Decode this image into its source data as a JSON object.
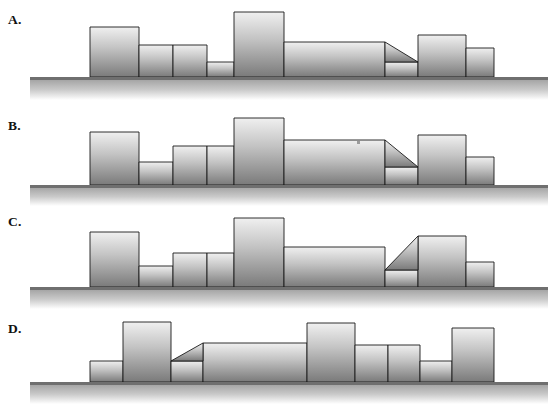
{
  "figure": {
    "type": "line-drawing",
    "background_color": "#ffffff",
    "ink_color": "#1a1a1a",
    "block_fill_top": "#f0f0f0",
    "block_fill_bottom": "#7a7a7a",
    "ground_color": "#6f6f6f",
    "partial_top_text": "",
    "panel_count": 4
  },
  "panels": [
    {
      "id": "A",
      "label": "A.",
      "label_x": 8,
      "label_y": 12,
      "top": 0,
      "height": 110,
      "ground_y": 77,
      "ground_x0": 30,
      "ground_x1": 548,
      "ground_thickness": 3,
      "ground_fade_height": 23,
      "blocks": [
        {
          "name": "block-1",
          "x": 90,
          "w": 49,
          "top": 27
        },
        {
          "name": "block-2",
          "x": 139,
          "w": 34,
          "top": 45
        },
        {
          "name": "block-3",
          "x": 173,
          "w": 34,
          "top": 45
        },
        {
          "name": "block-4",
          "x": 207,
          "w": 27,
          "top": 62
        },
        {
          "name": "block-5",
          "x": 234,
          "w": 50,
          "top": 12
        },
        {
          "name": "block-6",
          "x": 284,
          "w": 101,
          "top": 42
        },
        {
          "name": "block-7",
          "x": 385,
          "w": 33,
          "top": 62
        },
        {
          "name": "block-8",
          "x": 418,
          "w": 48,
          "top": 35
        },
        {
          "name": "block-9",
          "x": 466,
          "w": 28,
          "top": 48
        }
      ],
      "slope": {
        "name": "slope-descending",
        "x_start": 385,
        "y_start": 42,
        "x_end": 418,
        "y_end": 62,
        "direction": "down-right"
      }
    },
    {
      "id": "B",
      "label": "B.",
      "label_x": 8,
      "label_y": 118,
      "top": 110,
      "height": 98,
      "ground_y": 75,
      "ground_x0": 30,
      "ground_x1": 548,
      "ground_thickness": 3,
      "ground_fade_height": 21,
      "blocks": [
        {
          "name": "block-1",
          "x": 90,
          "w": 49,
          "top": 22
        },
        {
          "name": "block-2",
          "x": 139,
          "w": 34,
          "top": 52
        },
        {
          "name": "block-3",
          "x": 173,
          "w": 34,
          "top": 36
        },
        {
          "name": "block-4",
          "x": 207,
          "w": 27,
          "top": 36
        },
        {
          "name": "block-5",
          "x": 234,
          "w": 50,
          "top": 8
        },
        {
          "name": "block-6",
          "x": 284,
          "w": 101,
          "top": 30
        },
        {
          "name": "block-7",
          "x": 385,
          "w": 33,
          "top": 57
        },
        {
          "name": "block-8",
          "x": 418,
          "w": 48,
          "top": 25
        },
        {
          "name": "block-9",
          "x": 466,
          "w": 28,
          "top": 47
        }
      ],
      "slope": {
        "name": "slope-descending",
        "x_start": 385,
        "y_start": 30,
        "x_end": 418,
        "y_end": 57,
        "direction": "down-right"
      },
      "artifact": {
        "name": "stray-mark",
        "x": 357,
        "y": 31,
        "w": 3,
        "h": 3
      }
    },
    {
      "id": "C",
      "label": "C.",
      "label_x": 8,
      "label_y": 214,
      "top": 205,
      "height": 105,
      "ground_y": 82,
      "ground_x0": 30,
      "ground_x1": 548,
      "ground_thickness": 3,
      "ground_fade_height": 22,
      "blocks": [
        {
          "name": "block-1",
          "x": 90,
          "w": 49,
          "top": 27
        },
        {
          "name": "block-2",
          "x": 139,
          "w": 34,
          "top": 61
        },
        {
          "name": "block-3",
          "x": 173,
          "w": 34,
          "top": 48
        },
        {
          "name": "block-4",
          "x": 207,
          "w": 27,
          "top": 48
        },
        {
          "name": "block-5",
          "x": 234,
          "w": 50,
          "top": 13
        },
        {
          "name": "block-6",
          "x": 284,
          "w": 101,
          "top": 42
        },
        {
          "name": "block-7",
          "x": 385,
          "w": 33,
          "top": 65
        },
        {
          "name": "block-8",
          "x": 418,
          "w": 48,
          "top": 31
        },
        {
          "name": "block-9",
          "x": 466,
          "w": 28,
          "top": 57
        }
      ],
      "slope": {
        "name": "slope-ascending",
        "x_start": 385,
        "y_start": 65,
        "x_end": 418,
        "y_end": 31,
        "direction": "up-right"
      }
    },
    {
      "id": "D",
      "label": "D.",
      "label_x": 8,
      "label_y": 321,
      "top": 305,
      "height": 102,
      "ground_y": 77,
      "ground_x0": 30,
      "ground_x1": 548,
      "ground_thickness": 3,
      "ground_fade_height": 22,
      "blocks": [
        {
          "name": "block-1",
          "x": 90,
          "w": 33,
          "top": 56
        },
        {
          "name": "block-2",
          "x": 123,
          "w": 48,
          "top": 17
        },
        {
          "name": "block-3",
          "x": 171,
          "w": 32,
          "top": 56
        },
        {
          "name": "block-4",
          "x": 203,
          "w": 104,
          "top": 38
        },
        {
          "name": "block-5",
          "x": 307,
          "w": 48,
          "top": 18
        },
        {
          "name": "block-6",
          "x": 355,
          "w": 33,
          "top": 40
        },
        {
          "name": "block-7",
          "x": 388,
          "w": 32,
          "top": 40
        },
        {
          "name": "block-8",
          "x": 420,
          "w": 32,
          "top": 56
        },
        {
          "name": "block-9",
          "x": 452,
          "w": 42,
          "top": 23
        }
      ],
      "slope": {
        "name": "slope-ascending",
        "x_start": 171,
        "y_start": 56,
        "x_end": 203,
        "y_end": 38,
        "direction": "up-right"
      }
    }
  ]
}
